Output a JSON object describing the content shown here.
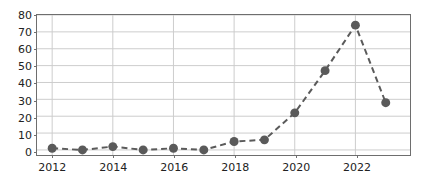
{
  "chart_data": {
    "type": "line",
    "title": "",
    "subtitle": "",
    "xlabel": "",
    "ylabel": "",
    "x": [
      2012,
      2013,
      2014,
      2015,
      2016,
      2017,
      2018,
      2019,
      2020,
      2021,
      2022,
      2023
    ],
    "values": [
      1,
      0,
      2,
      0,
      1,
      0,
      5,
      6,
      22,
      47,
      74,
      28
    ],
    "series": [
      {
        "name": "",
        "values": [
          1,
          0,
          2,
          0,
          1,
          0,
          5,
          6,
          22,
          47,
          74,
          28
        ]
      }
    ],
    "xlim": [
      2011.5,
      2023.8
    ],
    "ylim": [
      -3,
      80
    ],
    "xticks": [
      2012,
      2014,
      2016,
      2018,
      2020,
      2022
    ],
    "xtick_labels": [
      "2012",
      "2014",
      "2016",
      "2018",
      "2020",
      "2022"
    ],
    "yticks": [
      0,
      10,
      20,
      30,
      40,
      50,
      60,
      70,
      80
    ],
    "ytick_labels": [
      "0",
      "10",
      "20",
      "30",
      "40",
      "50",
      "60",
      "70",
      "80"
    ],
    "grid": true,
    "legend": false,
    "legend_position": "none",
    "line_style": "dashed",
    "marker": "circle",
    "marker_size": 9,
    "colors": {
      "line": "#5a5a5a",
      "marker": "#5a5a5a",
      "grid": "#cccccc",
      "axis": "#6e6e6e",
      "text": "#222222",
      "background": "#ffffff"
    },
    "annotations": []
  }
}
